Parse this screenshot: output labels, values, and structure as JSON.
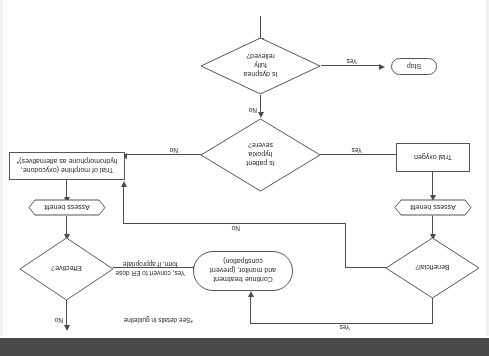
{
  "diagram": {
    "orientation": "rotated-180",
    "nodes": {
      "start_arrow": "",
      "dyspnea_relieved": "Is dyspnea\nfully\nrelieved?",
      "dyspnea_relieved_line1": "Is dyspnea",
      "dyspnea_relieved_line2": "fully",
      "dyspnea_relieved_line3": "relieved?",
      "stop": "Stop",
      "hypoxia_severe_line1": "Is patient",
      "hypoxia_severe_line2": "hypoxia",
      "hypoxia_severe_line3": "severe?",
      "trial_oxygen": "Trial oxygen",
      "assess_benefit_left": "Assess benefit",
      "beneficial": "Beneficial?",
      "trial_morphine_line1": "Trial of morphine (oxycodone,",
      "trial_morphine_line2": "hydromorphone as alternatives)*",
      "assess_benefit_right": "Assess benefit",
      "effective": "Effective?",
      "continue_treatment_line1": "Continue treatment",
      "continue_treatment_line2": "and monitor, (prevent",
      "continue_treatment_line3": "constipation)"
    },
    "edges": {
      "dyspnea_yes": "Yes",
      "dyspnea_no": "No",
      "hypoxia_yes": "Yes",
      "hypoxia_no": "No",
      "beneficial_yes": "Yes",
      "beneficial_no": "No",
      "effective_no": "No",
      "effective_yes_line1": "Yes, convert to ER dose",
      "effective_yes_line2": "form, if appropriate"
    },
    "footnote": "*See details in guideline",
    "colors": {
      "stroke": "#4d4d4d",
      "node_border": "#555555",
      "text": "#2b2b2b",
      "background": "#ffffff",
      "bottom_band": "#4a4a4a"
    }
  }
}
